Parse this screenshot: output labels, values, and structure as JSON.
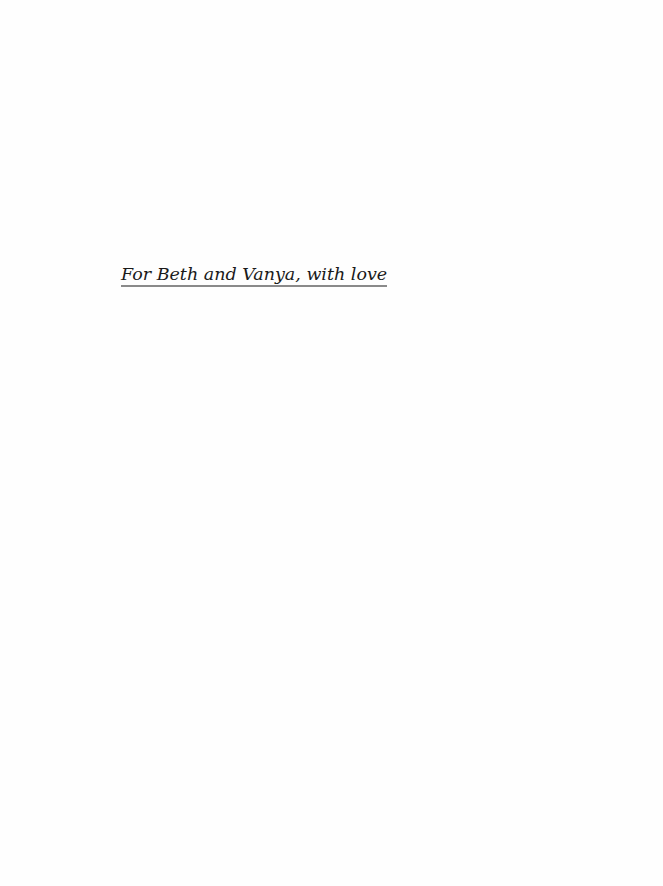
{
  "page": {
    "dedication": "For Beth and Vanya, with love"
  },
  "colors": {
    "text": "#1a1a1a",
    "underline": "#8a8a8a",
    "background": "#fefefe"
  }
}
